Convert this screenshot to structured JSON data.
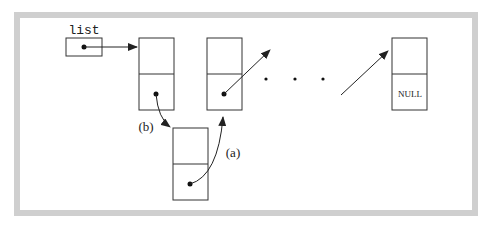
{
  "diagram": {
    "type": "linked-list-insertion",
    "pointer_label": "list",
    "null_label": "NULL",
    "ellipsis": "· · ·",
    "step_labels": {
      "a": "(a)",
      "b": "(b)"
    },
    "colors": {
      "frame": "#c8c8c8",
      "background": "#ffffff",
      "stroke": "#222222"
    },
    "nodes": [
      {
        "id": "node-1",
        "role": "first"
      },
      {
        "id": "node-2",
        "role": "second"
      },
      {
        "id": "node-last",
        "role": "last",
        "next": "NULL"
      },
      {
        "id": "node-new",
        "role": "inserted"
      }
    ]
  }
}
